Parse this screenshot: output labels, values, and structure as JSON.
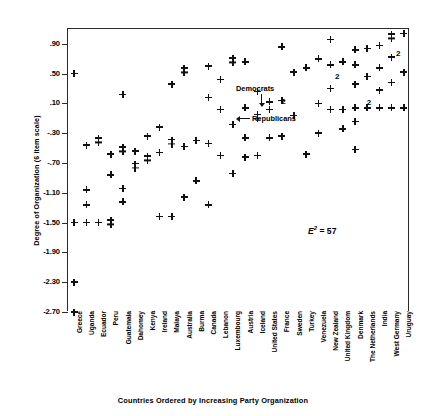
{
  "chart_data": {
    "type": "scatter",
    "title": "",
    "xlabel": "Countries Ordered by Increasing Party Organization",
    "ylabel": "Degree of Organization (6 item scale)",
    "ylim": [
      -2.7,
      1.1
    ],
    "yticks": [
      ".90",
      ".50",
      ".10",
      "-.30",
      "-.70",
      "-1.10",
      "-1.50",
      "-1.90",
      "-2.30",
      "-2.70"
    ],
    "ytick_values": [
      0.9,
      0.5,
      0.1,
      -0.3,
      -0.7,
      -1.1,
      -1.5,
      -1.9,
      -2.3,
      -2.7
    ],
    "grid": false,
    "legend_position": "none",
    "categories": [
      "Greece",
      "Uganda",
      "Ecuador",
      "Peru",
      "Guatemala",
      "Dahomey",
      "Kenya",
      "Ireland",
      "Malaya",
      "Australia",
      "Burma",
      "Canada",
      "Lebanon",
      "Luxembourg",
      "Austria",
      "Iceland",
      "United States",
      "France",
      "Sweden",
      "Turkey",
      "Venezuela",
      "New Zealand",
      "United Kingdom",
      "Denmark",
      "The Netherlands",
      "India",
      "West Germany",
      "Uruguay"
    ],
    "annotations": [
      {
        "text": "Democrats",
        "x": 17,
        "y": 0.33,
        "arrow": "down"
      },
      {
        "text": "Republicans",
        "x": 17,
        "y": 0.02,
        "arrow": "left"
      },
      {
        "text": "E2 = 57",
        "x": 23.5,
        "y": -1.22,
        "arrow": "none"
      }
    ],
    "count_labels": [
      {
        "label": "2",
        "x": 18.2,
        "y": 0.12
      },
      {
        "label": "2",
        "x": 22.6,
        "y": 0.46
      },
      {
        "label": "2",
        "x": 25.2,
        "y": 0.1
      },
      {
        "label": "2",
        "x": 27.6,
        "y": 0.76
      }
    ],
    "points": [
      {
        "x": 1,
        "y": 0.5,
        "n": 1
      },
      {
        "x": 1,
        "y": -1.5,
        "n": 1
      },
      {
        "x": 1,
        "y": -2.3,
        "n": 1
      },
      {
        "x": 1,
        "y": -2.7,
        "n": 1
      },
      {
        "x": 2,
        "y": -0.46,
        "n": 1
      },
      {
        "x": 2,
        "y": -1.06,
        "n": 1
      },
      {
        "x": 2,
        "y": -1.26,
        "n": 1
      },
      {
        "x": 2,
        "y": -1.5,
        "n": 1
      },
      {
        "x": 3,
        "y": -0.4,
        "n": 2
      },
      {
        "x": 3,
        "y": -1.5,
        "n": 1
      },
      {
        "x": 4,
        "y": -0.58,
        "n": 1
      },
      {
        "x": 4,
        "y": -0.86,
        "n": 1
      },
      {
        "x": 4,
        "y": -1.5,
        "n": 2
      },
      {
        "x": 5,
        "y": 0.22,
        "n": 1
      },
      {
        "x": 5,
        "y": -0.52,
        "n": 2
      },
      {
        "x": 5,
        "y": -1.04,
        "n": 1
      },
      {
        "x": 5,
        "y": -1.22,
        "n": 1
      },
      {
        "x": 6,
        "y": -0.54,
        "n": 1
      },
      {
        "x": 6,
        "y": -0.74,
        "n": 2
      },
      {
        "x": 7,
        "y": -0.34,
        "n": 1
      },
      {
        "x": 7,
        "y": -0.64,
        "n": 2
      },
      {
        "x": 8,
        "y": -0.22,
        "n": 1
      },
      {
        "x": 8,
        "y": -0.56,
        "n": 1
      },
      {
        "x": 8,
        "y": -1.42,
        "n": 1
      },
      {
        "x": 9,
        "y": 0.36,
        "n": 1
      },
      {
        "x": 9,
        "y": -0.42,
        "n": 2
      },
      {
        "x": 9,
        "y": -1.42,
        "n": 1
      },
      {
        "x": 10,
        "y": 0.54,
        "n": 2
      },
      {
        "x": 10,
        "y": -0.48,
        "n": 1
      },
      {
        "x": 10,
        "y": -1.16,
        "n": 1
      },
      {
        "x": 11,
        "y": -0.4,
        "n": 1
      },
      {
        "x": 11,
        "y": -0.94,
        "n": 1
      },
      {
        "x": 12,
        "y": 0.6,
        "n": 1
      },
      {
        "x": 12,
        "y": 0.18,
        "n": 1
      },
      {
        "x": 12,
        "y": -0.44,
        "n": 1
      },
      {
        "x": 12,
        "y": -1.26,
        "n": 1
      },
      {
        "x": 13,
        "y": 0.42,
        "n": 1
      },
      {
        "x": 13,
        "y": 0.02,
        "n": 1
      },
      {
        "x": 13,
        "y": -0.6,
        "n": 1
      },
      {
        "x": 14,
        "y": 0.68,
        "n": 2
      },
      {
        "x": 14,
        "y": -0.18,
        "n": 1
      },
      {
        "x": 14,
        "y": -0.84,
        "n": 1
      },
      {
        "x": 15,
        "y": 0.66,
        "n": 1
      },
      {
        "x": 15,
        "y": 0.04,
        "n": 1
      },
      {
        "x": 15,
        "y": -0.36,
        "n": 1
      },
      {
        "x": 15,
        "y": -0.62,
        "n": 1
      },
      {
        "x": 16,
        "y": 0.26,
        "n": 1
      },
      {
        "x": 16,
        "y": -0.08,
        "n": 2
      },
      {
        "x": 16,
        "y": -0.6,
        "n": 1
      },
      {
        "x": 17,
        "y": 0.12,
        "n": 1
      },
      {
        "x": 17,
        "y": 0.02,
        "n": 1
      },
      {
        "x": 17,
        "y": -0.36,
        "n": 1
      },
      {
        "x": 18,
        "y": 0.86,
        "n": 1
      },
      {
        "x": 18,
        "y": 0.14,
        "n": 1
      },
      {
        "x": 18,
        "y": -0.34,
        "n": 1
      },
      {
        "x": 19,
        "y": 0.52,
        "n": 1
      },
      {
        "x": 19,
        "y": -0.06,
        "n": 1
      },
      {
        "x": 20,
        "y": 0.58,
        "n": 1
      },
      {
        "x": 20,
        "y": -0.58,
        "n": 1
      },
      {
        "x": 21,
        "y": 0.7,
        "n": 1
      },
      {
        "x": 21,
        "y": 0.1,
        "n": 1
      },
      {
        "x": 21,
        "y": -0.3,
        "n": 1
      },
      {
        "x": 22,
        "y": 0.96,
        "n": 1
      },
      {
        "x": 22,
        "y": 0.62,
        "n": 1
      },
      {
        "x": 22,
        "y": 0.3,
        "n": 1
      },
      {
        "x": 22,
        "y": 0.02,
        "n": 1
      },
      {
        "x": 23,
        "y": 0.66,
        "n": 1
      },
      {
        "x": 23,
        "y": 0.02,
        "n": 1
      },
      {
        "x": 23,
        "y": -0.24,
        "n": 1
      },
      {
        "x": 24,
        "y": 0.82,
        "n": 1
      },
      {
        "x": 24,
        "y": 0.62,
        "n": 1
      },
      {
        "x": 24,
        "y": 0.36,
        "n": 1
      },
      {
        "x": 24,
        "y": 0.04,
        "n": 1
      },
      {
        "x": 24,
        "y": -0.14,
        "n": 1
      },
      {
        "x": 24,
        "y": -0.52,
        "n": 1
      },
      {
        "x": 25,
        "y": 0.84,
        "n": 1
      },
      {
        "x": 25,
        "y": 0.46,
        "n": 1
      },
      {
        "x": 25,
        "y": 0.04,
        "n": 1
      },
      {
        "x": 26,
        "y": 0.88,
        "n": 1
      },
      {
        "x": 26,
        "y": 0.58,
        "n": 1
      },
      {
        "x": 26,
        "y": 0.28,
        "n": 1
      },
      {
        "x": 26,
        "y": 0.04,
        "n": 1
      },
      {
        "x": 27,
        "y": 1.0,
        "n": 2
      },
      {
        "x": 27,
        "y": 0.72,
        "n": 1
      },
      {
        "x": 27,
        "y": 0.38,
        "n": 1
      },
      {
        "x": 27,
        "y": 0.04,
        "n": 1
      },
      {
        "x": 28,
        "y": 1.04,
        "n": 1
      },
      {
        "x": 28,
        "y": 0.52,
        "n": 1
      },
      {
        "x": 28,
        "y": 0.04,
        "n": 1
      }
    ]
  }
}
